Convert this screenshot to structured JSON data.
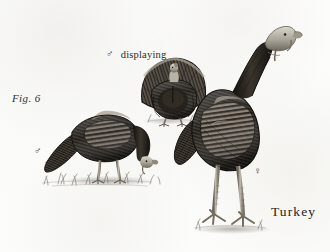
{
  "plate": {
    "figure_label": "Fig. 6",
    "caption": "Turkey",
    "paper_color": "#fdfdfc",
    "ink_color": "#2b2b2b",
    "width": 330,
    "height": 252
  },
  "annotations": [
    {
      "id": "fig-number",
      "text": "Fig. 6",
      "style": "italic",
      "x": 12,
      "y": 93
    },
    {
      "id": "male-displaying",
      "symbol": "♂",
      "symbol_name": "male-symbol",
      "text": "displaying",
      "x": 106,
      "y": 49
    },
    {
      "id": "male-foreground",
      "symbol": "♂",
      "symbol_name": "male-symbol",
      "text": "",
      "x": 34,
      "y": 146
    },
    {
      "id": "female-right",
      "symbol": "♀",
      "symbol_name": "female-symbol",
      "text": "",
      "x": 254,
      "y": 166
    },
    {
      "id": "plate-caption",
      "text": "Turkey",
      "x": 271,
      "y": 205
    }
  ],
  "subjects": [
    {
      "id": "turkey-foreground-male",
      "name": "foreground male turkey feeding",
      "sex": "male",
      "pose": "walking, head lowered to ground, facing right",
      "position": "left-center",
      "plumage": "dark barred body, pale bald head"
    },
    {
      "id": "turkey-displaying-male",
      "name": "background male turkey displaying",
      "sex": "male",
      "pose": "tail fanned, wings drooped, facing viewer",
      "position": "upper-center",
      "plumage": "dark body with fanned tail"
    },
    {
      "id": "turkey-standing-female",
      "name": "large standing female turkey",
      "sex": "female",
      "pose": "standing upright, long neck, head turned right",
      "position": "right, foreground",
      "plumage": "barred wing feathers, pale gray bare head, pale legs"
    }
  ],
  "ground": {
    "id": "ground-line",
    "description": "sparse grass tufts along baseline",
    "baseline_y": 182
  }
}
